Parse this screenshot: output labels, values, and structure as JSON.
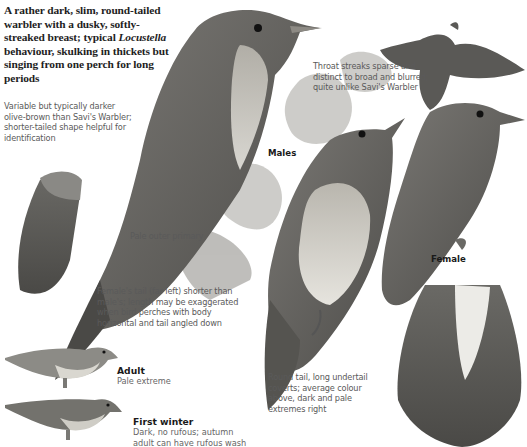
{
  "plate": {
    "intro": {
      "part1": "A rather dark, slim, round-tailed warbler with a dusky, softly-streaked breast; typical ",
      "genus": "Locustella",
      "part2": " behaviour, skulking in thickets but singing from one perch for long periods"
    },
    "annotations": {
      "colour_note": "Variable but typically darker olive-brown than Savi's Warbler; shorter-tailed shape helpful for identification",
      "throat_note": "Throat streaks sparse and distinct to broad and blurred; quite unlike Savi's Warbler",
      "outer_primary": "Pale outer primary",
      "female_tail_note": "Female's tail (far left) shorter than male's; length may be exaggerated when bird perches with body horizontal and tail angled down",
      "tail_note": "Round tail, long undertail coverts; average colour above, dark and pale extremes right"
    },
    "labels": {
      "males": "Males",
      "female": "Female"
    },
    "variants": [
      {
        "title": "Adult",
        "body": "Pale extreme"
      },
      {
        "title": "First winter",
        "body": "Dark, no rufous; autumn adult can have rufous wash"
      }
    ],
    "colors": {
      "background": "#ffffff",
      "plumage_dark": "#4a4a48",
      "plumage_mid": "#6e6d69",
      "breast_pale": "#d8d6d0",
      "foliage": "#9a9a96",
      "text_dark": "#1e1e1e",
      "text_grey": "#5a5a5a"
    }
  }
}
